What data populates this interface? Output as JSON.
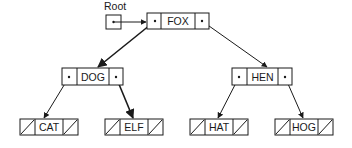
{
  "diagram": {
    "type": "binary-search-tree",
    "root_label": "Root",
    "nodes": [
      {
        "id": "fox",
        "value": "FOX",
        "x": 147,
        "y": 13,
        "left": "pointer",
        "right": "pointer"
      },
      {
        "id": "dog",
        "value": "DOG",
        "x": 62,
        "y": 68,
        "left": "pointer",
        "right": "pointer"
      },
      {
        "id": "hen",
        "value": "HEN",
        "x": 232,
        "y": 68,
        "left": "pointer",
        "right": "pointer"
      },
      {
        "id": "cat",
        "value": "CAT",
        "x": 20,
        "y": 119,
        "left": "null",
        "right": "null"
      },
      {
        "id": "elf",
        "value": "ELF",
        "x": 105,
        "y": 119,
        "left": "null",
        "right": "null"
      },
      {
        "id": "hat",
        "value": "HAT",
        "x": 190,
        "y": 119,
        "left": "null",
        "right": "null"
      },
      {
        "id": "hog",
        "value": "HOG",
        "x": 275,
        "y": 119,
        "left": "null",
        "right": "null"
      }
    ],
    "edges": [
      {
        "from": "root",
        "to": "fox"
      },
      {
        "from": "fox",
        "side": "left",
        "to": "dog"
      },
      {
        "from": "fox",
        "side": "right",
        "to": "hen"
      },
      {
        "from": "dog",
        "side": "left",
        "to": "cat"
      },
      {
        "from": "dog",
        "side": "right",
        "to": "elf"
      },
      {
        "from": "hen",
        "side": "left",
        "to": "hat"
      },
      {
        "from": "hen",
        "side": "right",
        "to": "hog"
      }
    ],
    "colors": {
      "line": "#1a1a1a",
      "background": "#ffffff"
    }
  }
}
